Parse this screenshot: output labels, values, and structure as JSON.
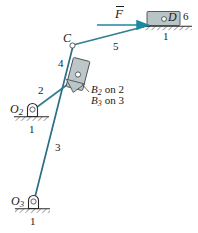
{
  "figure": {
    "colors": {
      "link": "#2e7f91",
      "link_dark": "#2a6f86",
      "force_arrow": "#1c8a9e",
      "block_fill": "#b9c4c6",
      "block_stroke": "#4d4d4d",
      "text": "#1a1a1a",
      "ground": "#2b2b2b",
      "background": "#ffffff"
    },
    "labels": {
      "force": "F",
      "force_overbar": "–",
      "point_c": "C",
      "point_d": "D",
      "pivot_o2_base": "O",
      "pivot_o2_sub": "2",
      "pivot_o3_base": "O",
      "pivot_o3_sub": "3",
      "link_1_top": "1",
      "link_1_o2": "1",
      "link_1_o3": "1",
      "link_2": "2",
      "link_3": "3",
      "link_4": "4",
      "link_5": "5",
      "link_6": "6",
      "coincident_b2_base": "B",
      "coincident_b2_sub": "2",
      "coincident_b2_tail": "on 2",
      "coincident_b3_base": "B",
      "coincident_b3_sub": "3",
      "coincident_b3_tail": "on 3"
    },
    "geometry": {
      "point_d": [
        168,
        19
      ],
      "point_c": [
        72,
        45
      ],
      "point_b": [
        78,
        78
      ],
      "pivot_o2": [
        31,
        110
      ],
      "pivot_o3": [
        32,
        202
      ],
      "force_arrow_from": [
        97,
        25
      ],
      "force_arrow_to": [
        150,
        25
      ]
    }
  }
}
